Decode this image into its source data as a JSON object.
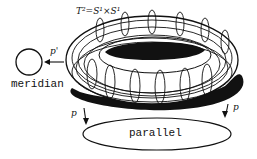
{
  "diagram": {
    "title_label": "T²=S¹×S¹",
    "meridian_label": "meridian",
    "parallel_label": "parallel",
    "projection_meridian": "p'",
    "projection_left": "p",
    "projection_right": "p",
    "colors": {
      "stroke": "#111111",
      "background": "#ffffff",
      "shadow": "#111111"
    }
  }
}
